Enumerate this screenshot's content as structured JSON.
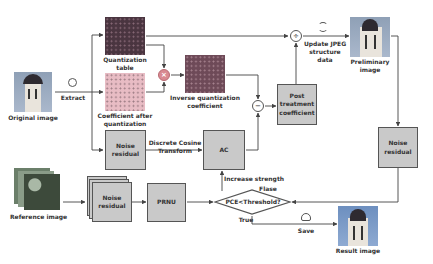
{
  "diagram": {
    "nodes": {
      "original_image": {
        "label": "Original image"
      },
      "quantization_table": {
        "label": "Quantization table"
      },
      "coefficient_after_quantization": {
        "label": "Coefficient after quantization"
      },
      "inverse_quantization_coefficient": {
        "label": "Inverse quantization coefficient"
      },
      "post_treatment_coefficient": {
        "label": "Post treatment coefficient"
      },
      "preliminary_image": {
        "label": "Preliminary image"
      },
      "noise_residual_top": {
        "label": "Noise residual"
      },
      "ac": {
        "label": "AC"
      },
      "noise_residual_right": {
        "label": "Noise residual"
      },
      "reference_image": {
        "label": "Reference image"
      },
      "noise_residual_stack": {
        "label": "Noise residual"
      },
      "prnu": {
        "label": "PRNU"
      },
      "decision": {
        "label": "PCE<Threshold?"
      },
      "result_image": {
        "label": "Result image"
      }
    },
    "operators": {
      "multiply": "×",
      "subtract": "−",
      "divide": "÷"
    },
    "edges": {
      "extract": "Extract",
      "dct": "Discrete Cosine Transform",
      "update_jpeg": "Update JPEG structure data",
      "increase_strength": "Increase strength",
      "false": "Flase",
      "true": "True",
      "save": "Save"
    },
    "icons": {
      "extract": "cycle-icon",
      "update": "refresh-icon",
      "save": "cloud-upload-icon"
    },
    "colors": {
      "box_fill": "#c9c9c9",
      "box_border": "#555555",
      "line": "#444444",
      "quant_table": "#4a3540",
      "coeff_after": "#e8bcc4",
      "inverse_coeff": "#6e4a58",
      "multiply_op": "#d98a92"
    }
  }
}
